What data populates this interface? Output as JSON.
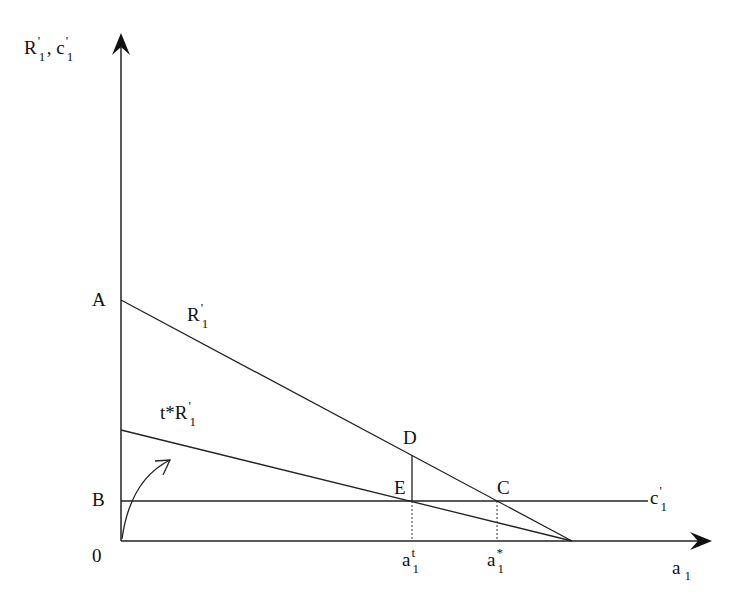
{
  "diagram": {
    "type": "economic-graph",
    "y_axis": {
      "label_main": "R",
      "label_prime": "'",
      "label_sub": "1",
      "label_sep": ", ",
      "label_main2": "c",
      "label_prime2": "'",
      "label_sub2": "1"
    },
    "x_axis": {
      "label_main": "a",
      "label_sub": "1"
    },
    "origin_label": "0",
    "points": {
      "A": "A",
      "B": "B",
      "C": "C",
      "D": "D",
      "E": "E"
    },
    "curves": {
      "R1": {
        "main": "R",
        "prime": "'",
        "sub": "1"
      },
      "tR1": {
        "main": "t*R",
        "prime": "'",
        "sub": "1"
      },
      "c1": {
        "main": "c",
        "prime": "'",
        "sub": "1"
      }
    },
    "x_ticks": {
      "at": {
        "main": "a",
        "sup": "t",
        "sub": "1"
      },
      "astar": {
        "main": "a",
        "sup": "*",
        "sub": "1"
      }
    },
    "colors": {
      "line": "#222222",
      "background": "#ffffff"
    }
  }
}
